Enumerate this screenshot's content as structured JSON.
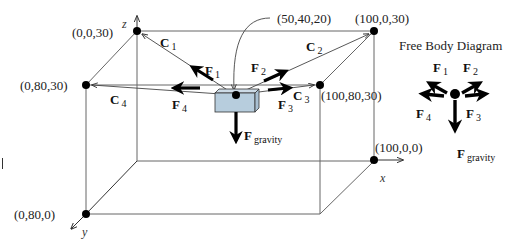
{
  "diagram": {
    "type": "3D static equilibrium – box suspended by four cables",
    "colors": {
      "lines": "#555555",
      "force_arrows": "#000000",
      "box_fill": "#b7cddd",
      "box_top": "#cddbe6",
      "box_stroke": "#333333"
    },
    "points": [
      {
        "label": "(0,0,30)"
      },
      {
        "label": "(0,80,30)"
      },
      {
        "label": "(0,80,0)"
      },
      {
        "label": "(100,0,30)"
      },
      {
        "label": "(100,80,30)"
      },
      {
        "label": "(100,0,0)"
      },
      {
        "label": "(50,40,20)"
      }
    ],
    "axes": {
      "x": "x",
      "y": "y",
      "z": "z"
    },
    "cables": [
      {
        "name": "C",
        "sub": "1"
      },
      {
        "name": "C",
        "sub": "2"
      },
      {
        "name": "C",
        "sub": "3"
      },
      {
        "name": "C",
        "sub": "4"
      }
    ],
    "forces": [
      {
        "name": "F",
        "sub": "1"
      },
      {
        "name": "F",
        "sub": "2"
      },
      {
        "name": "F",
        "sub": "3"
      },
      {
        "name": "F",
        "sub": "4"
      },
      {
        "name": "F",
        "sub": "gravity"
      }
    ]
  },
  "free_body": {
    "title": "Free Body Diagram",
    "forces": [
      {
        "name": "F",
        "sub": "1"
      },
      {
        "name": "F",
        "sub": "2"
      },
      {
        "name": "F",
        "sub": "3"
      },
      {
        "name": "F",
        "sub": "4"
      },
      {
        "name": "F",
        "sub": "gravity"
      }
    ]
  }
}
